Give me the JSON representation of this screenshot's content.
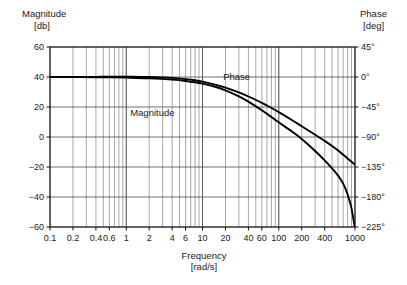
{
  "chart_data": {
    "type": "line",
    "title": "",
    "xlabel": "Frequency",
    "xunit": "[rad/s]",
    "xscale": "log",
    "xlim": [
      0.1,
      1000
    ],
    "xticks": [
      0.1,
      0.2,
      0.4,
      0.6,
      1,
      2,
      4,
      6,
      10,
      20,
      40,
      60,
      100,
      200,
      400,
      1000
    ],
    "xtick_labels": [
      "0.1",
      "0.2",
      "0.4",
      "0.6",
      "1",
      "2",
      "4",
      "6",
      "10",
      "20",
      "40",
      "60",
      "100",
      "200",
      "400",
      "1000"
    ],
    "xminor_ticks": [
      0.1,
      0.2,
      0.3,
      0.4,
      0.5,
      0.6,
      0.7,
      0.8,
      0.9,
      1,
      2,
      3,
      4,
      5,
      6,
      7,
      8,
      9,
      10,
      20,
      30,
      40,
      50,
      60,
      70,
      80,
      90,
      100,
      200,
      300,
      400,
      500,
      600,
      700,
      800,
      900,
      1000
    ],
    "grid": true,
    "legend_position": "inline-annotations",
    "left_axis": {
      "label": "Magnitude",
      "unit": "[db]",
      "ylim": [
        -60,
        60
      ],
      "yticks": [
        60,
        40,
        20,
        0,
        -20,
        -40,
        -60
      ],
      "ytick_labels": [
        "60",
        "40",
        "20",
        "0",
        "−20",
        "−40",
        "−60"
      ]
    },
    "right_axis": {
      "label": "Phase",
      "unit": "[deg]",
      "ylim": [
        -225,
        45
      ],
      "yticks": [
        45,
        0,
        -45,
        -90,
        -135,
        -180,
        -225
      ],
      "ytick_labels": [
        "45°",
        "0°",
        "−45°",
        "−90°",
        "−135°",
        "−180°",
        "−225°"
      ]
    },
    "series": [
      {
        "name": "Magnitude",
        "axis": "left",
        "annotation": "Magnitude",
        "annotation_x": 2.2,
        "annotation_y": 14,
        "points": [
          [
            0.1,
            40.0
          ],
          [
            0.15,
            40.0
          ],
          [
            0.2,
            40.0
          ],
          [
            0.3,
            40.1
          ],
          [
            0.4,
            40.1
          ],
          [
            0.6,
            40.2
          ],
          [
            0.8,
            40.2
          ],
          [
            1.0,
            40.2
          ],
          [
            1.5,
            40.1
          ],
          [
            2.0,
            40.0
          ],
          [
            3.0,
            39.7
          ],
          [
            4.0,
            39.4
          ],
          [
            6.0,
            38.6
          ],
          [
            8.0,
            37.8
          ],
          [
            10.0,
            36.9
          ],
          [
            15.0,
            34.8
          ],
          [
            20.0,
            32.9
          ],
          [
            30.0,
            29.7
          ],
          [
            40.0,
            27.0
          ],
          [
            60.0,
            22.8
          ],
          [
            80.0,
            19.4
          ],
          [
            100.0,
            16.6
          ],
          [
            150.0,
            11.2
          ],
          [
            200.0,
            7.2
          ],
          [
            300.0,
            1.5
          ],
          [
            400.0,
            -2.6
          ],
          [
            500.0,
            -6.0
          ],
          [
            600.0,
            -9.0
          ],
          [
            700.0,
            -11.8
          ],
          [
            800.0,
            -14.3
          ],
          [
            900.0,
            -16.5
          ],
          [
            1000.0,
            -18.5
          ]
        ]
      },
      {
        "name": "Phase",
        "axis": "right",
        "annotation": "Phase",
        "annotation_x": 28,
        "annotation_y": -5,
        "points": [
          [
            0.1,
            0.0
          ],
          [
            0.2,
            0.0
          ],
          [
            0.4,
            -0.3
          ],
          [
            0.6,
            -0.5
          ],
          [
            1.0,
            -1.0
          ],
          [
            2.0,
            -2.0
          ],
          [
            4.0,
            -4.0
          ],
          [
            6.0,
            -6.0
          ],
          [
            10.0,
            -10.0
          ],
          [
            15.0,
            -15.0
          ],
          [
            20.0,
            -20.0
          ],
          [
            30.0,
            -29.0
          ],
          [
            40.0,
            -37.0
          ],
          [
            60.0,
            -50.0
          ],
          [
            80.0,
            -60.0
          ],
          [
            100.0,
            -68.0
          ],
          [
            150.0,
            -82.0
          ],
          [
            200.0,
            -93.0
          ],
          [
            300.0,
            -111.0
          ],
          [
            400.0,
            -125.0
          ],
          [
            500.0,
            -137.0
          ],
          [
            600.0,
            -148.0
          ],
          [
            700.0,
            -160.0
          ],
          [
            800.0,
            -176.0
          ],
          [
            900.0,
            -197.0
          ],
          [
            1000.0,
            -228.0
          ]
        ]
      }
    ]
  },
  "labels": {
    "left_axis_name": "Magnitude",
    "left_axis_unit": "[db]",
    "right_axis_name": "Phase",
    "right_axis_unit": "[deg]",
    "x_axis_name": "Frequency",
    "x_axis_unit": "[rad/s]",
    "magnitude_curve_label": "Magnitude",
    "phase_curve_label": "Phase"
  }
}
